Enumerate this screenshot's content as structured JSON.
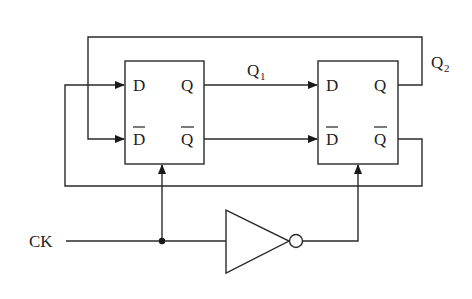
{
  "diagram": {
    "type": "circuit-schematic",
    "colors": {
      "line": "#2a2a2a",
      "text": "#222222",
      "background": "#ffffff"
    },
    "flip_flops": [
      {
        "id": "ff1",
        "inputs": {
          "d": "D",
          "d_bar": "D"
        },
        "outputs": {
          "q": "Q",
          "q_bar": "Q"
        },
        "clock": "CK"
      },
      {
        "id": "ff2",
        "inputs": {
          "d": "D",
          "d_bar": "D"
        },
        "outputs": {
          "q": "Q",
          "q_bar": "Q"
        },
        "clock": "CK (inverted)"
      }
    ],
    "signals": {
      "q1": {
        "main": "Q",
        "sub": "1"
      },
      "q2": {
        "main": "Q",
        "sub": "2"
      },
      "clock": "CK"
    },
    "gates": [
      {
        "type": "inverter",
        "input": "CK",
        "output": "ff2 clock"
      }
    ],
    "connections": [
      "FF1.Q -> FF2.D (Q1)",
      "FF1.Qbar -> FF2.Dbar",
      "FF2.Q (Q2) -> FF1.Dbar (top feedback loop)",
      "FF2.Qbar -> FF1.D (bottom feedback loop)",
      "CK -> FF1 clock",
      "CK -> inverter -> FF2 clock"
    ]
  }
}
